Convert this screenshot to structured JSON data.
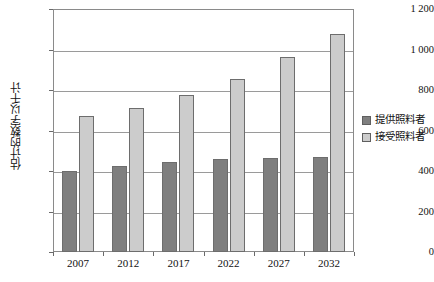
{
  "chart_data": {
    "type": "bar",
    "title": "",
    "subtitle": "",
    "xlabel": "",
    "ylabel": "估计的数字以千计",
    "categories": [
      "2007",
      "2012",
      "2017",
      "2022",
      "2027",
      "2032"
    ],
    "series": [
      {
        "name": "提供照料者",
        "color": "#7f7f7f",
        "values": [
          400,
          425,
          445,
          460,
          465,
          470
        ]
      },
      {
        "name": "接受照料者",
        "color": "#cccccc",
        "values": [
          670,
          710,
          775,
          855,
          965,
          1075
        ]
      }
    ],
    "ylim": [
      0,
      1200
    ],
    "ytick_values": [
      0,
      200,
      400,
      600,
      800,
      1000,
      1200
    ],
    "ytick_labels": [
      "0",
      "200",
      "400",
      "600",
      "800",
      "1 000",
      "1 200"
    ],
    "grid": true,
    "legend_position": "right",
    "legend": [
      {
        "label": "提供照料者",
        "color": "#7f7f7f"
      },
      {
        "label": "接受照料者",
        "color": "#cccccc"
      }
    ],
    "annotations": []
  },
  "colors": {
    "series_dark": "#7f7f7f",
    "series_light": "#cccccc",
    "gridline": "#9a9a9a",
    "frame": "#8a8a8a",
    "text": "#111111",
    "background": "#ffffff"
  }
}
